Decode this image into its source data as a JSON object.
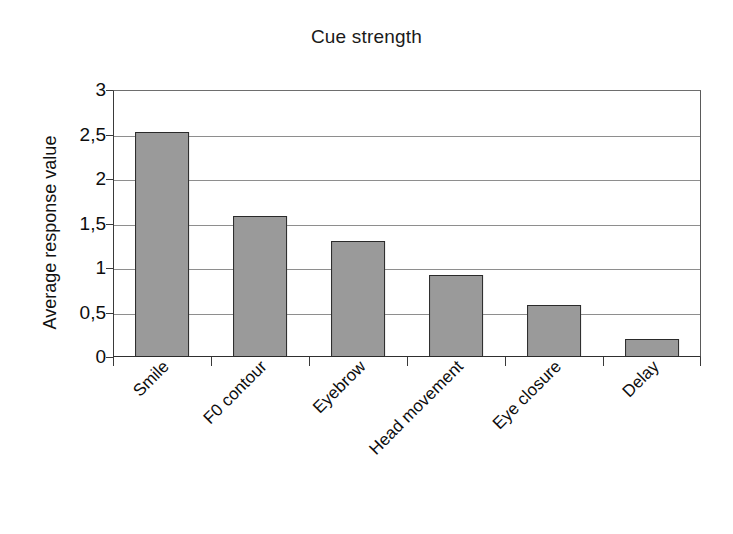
{
  "chart_data": {
    "type": "bar",
    "title": "Cue strength",
    "xlabel": "",
    "ylabel": "Average response value",
    "categories": [
      "Smile",
      "F0 contour",
      "Eyebrow",
      "Head movement",
      "Eye closure",
      "Delay"
    ],
    "values": [
      2.53,
      1.58,
      1.3,
      0.92,
      0.59,
      0.2
    ],
    "ylim": [
      0,
      3
    ],
    "ytick_values": [
      0,
      0.5,
      1,
      1.5,
      2,
      2.5,
      3
    ],
    "ytick_labels": [
      "0",
      "0,5",
      "1",
      "1,5",
      "2",
      "2,5",
      "3"
    ],
    "grid": true,
    "legend": false,
    "decimal_separator": ",",
    "bar_fill_color": "#9a9a9a",
    "bar_border_color": "#2a2a2a",
    "gridline_color": "#8e8e8e",
    "axis_color": "#2f2f2f",
    "xtick_label_rotation": -45
  }
}
